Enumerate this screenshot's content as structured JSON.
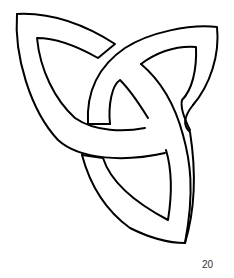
{
  "figure": {
    "stroke_color": "#000000",
    "fill_color": "#ffffff"
  },
  "page": {
    "number": "20"
  }
}
